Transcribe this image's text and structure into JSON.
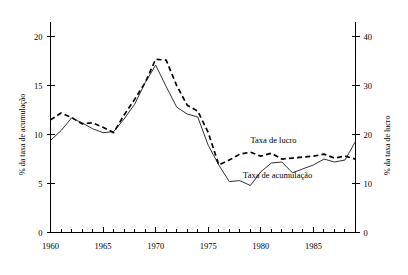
{
  "chart_data": {
    "type": "line",
    "title": "",
    "xlabel": "",
    "ylabel": "% da taxa de acumulação",
    "y2label": "% da taxa de lucro",
    "grid": false,
    "legend_position": "inline-annotation",
    "x": [
      1960,
      1961,
      1962,
      1963,
      1964,
      1965,
      1966,
      1967,
      1968,
      1969,
      1970,
      1971,
      1972,
      1973,
      1974,
      1975,
      1976,
      1977,
      1978,
      1979,
      1980,
      1981,
      1982,
      1983,
      1984,
      1985,
      1986,
      1987,
      1988,
      1989
    ],
    "x_tick_labels": [
      "1960",
      "1965",
      "1970",
      "1975",
      "1980",
      "1985"
    ],
    "x_tick_values": [
      1960,
      1965,
      1970,
      1975,
      1980,
      1985
    ],
    "xlim": [
      1960,
      1989
    ],
    "ylim": [
      0,
      21.5
    ],
    "y_tick_labels": [
      "0",
      "5",
      "10",
      "15",
      "20"
    ],
    "y_tick_values": [
      0,
      5,
      10,
      15,
      20
    ],
    "y2lim": [
      0,
      43
    ],
    "y2_tick_labels": [
      "0",
      "10",
      "20",
      "30",
      "40"
    ],
    "y2_tick_values": [
      0,
      10,
      20,
      30,
      40
    ],
    "series": [
      {
        "name": "Taxa de lucro",
        "axis": "right",
        "style": "dashed",
        "annotation_x": 1981.2,
        "annotation_y": 18.2,
        "values": [
          23.0,
          24.4,
          23.5,
          22.2,
          22.4,
          21.5,
          20.4,
          24.0,
          27.2,
          30.6,
          35.4,
          35.2,
          30.0,
          26.0,
          24.8,
          20.4,
          13.8,
          14.8,
          16.0,
          16.4,
          15.6,
          16.2,
          15.0,
          15.2,
          15.4,
          15.6,
          16.0,
          15.2,
          15.6,
          15.0
        ]
      },
      {
        "name": "Taxa de acumulação",
        "axis": "left",
        "style": "solid",
        "annotation_x": 1981.6,
        "annotation_y": 5.6,
        "values": [
          9.4,
          10.4,
          11.7,
          11.2,
          10.6,
          10.2,
          10.3,
          11.6,
          13.1,
          15.3,
          17.1,
          14.9,
          12.8,
          12.1,
          11.8,
          8.9,
          6.9,
          5.2,
          5.3,
          4.8,
          6.2,
          7.1,
          7.2,
          6.1,
          6.5,
          6.9,
          7.5,
          7.2,
          7.4,
          9.3
        ]
      }
    ]
  },
  "axes": {
    "left_title": "% da taxa de acumulação",
    "right_title": "% da taxa de lucro"
  }
}
